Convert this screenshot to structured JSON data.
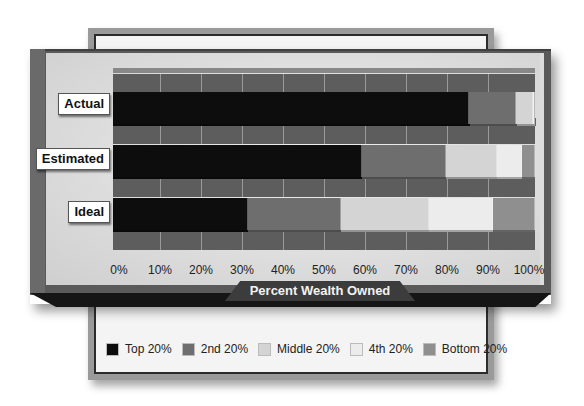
{
  "chart_data": {
    "type": "bar",
    "orientation": "horizontal",
    "stacked": true,
    "title": "",
    "xlabel": "Percent Wealth Owned",
    "ylabel": "",
    "xlim": [
      0,
      100
    ],
    "x_ticks": [
      "0%",
      "10%",
      "20%",
      "30%",
      "40%",
      "50%",
      "60%",
      "70%",
      "80%",
      "90%",
      "100%"
    ],
    "categories": [
      "Actual",
      "Estimated",
      "Ideal"
    ],
    "series": [
      {
        "name": "Top 20%",
        "color": "#0d0d0d",
        "values": [
          84,
          59,
          32
        ]
      },
      {
        "name": "2nd 20%",
        "color": "#6e6e6e",
        "values": [
          11,
          20,
          22
        ]
      },
      {
        "name": "Middle 20%",
        "color": "#d4d4d4",
        "values": [
          4,
          12,
          21
        ]
      },
      {
        "name": "4th 20%",
        "color": "#ececec",
        "values": [
          0.2,
          6,
          15
        ]
      },
      {
        "name": "Bottom 20%",
        "color": "#8f8f8f",
        "values": [
          0.1,
          3,
          10
        ]
      }
    ],
    "legend_position": "bottom",
    "grid": true
  },
  "rows": [
    {
      "label": "Actual"
    },
    {
      "label": "Estimated"
    },
    {
      "label": "Ideal"
    }
  ],
  "axis": {
    "title": "Percent Wealth Owned",
    "ticks": [
      "0%",
      "10%",
      "20%",
      "30%",
      "40%",
      "50%",
      "60%",
      "70%",
      "80%",
      "90%",
      "100%"
    ]
  },
  "legend": {
    "items": [
      {
        "label": "Top 20%",
        "color": "#0d0d0d"
      },
      {
        "label": "2nd 20%",
        "color": "#6e6e6e"
      },
      {
        "label": "Middle 20%",
        "color": "#d4d4d4"
      },
      {
        "label": "4th 20%",
        "color": "#ececec"
      },
      {
        "label": "Bottom 20%",
        "color": "#8f8f8f"
      }
    ]
  }
}
